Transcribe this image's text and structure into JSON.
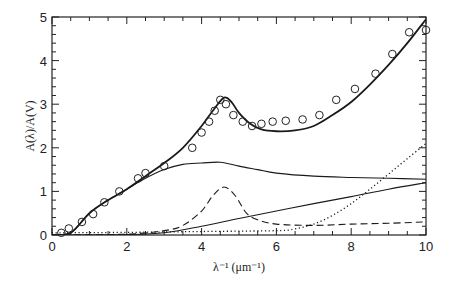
{
  "chart_data": {
    "type": "line",
    "title": "",
    "xlabel": "λ⁻¹ (μm⁻¹)",
    "ylabel": "A(λ)/A(V)",
    "xlim": [
      0,
      10
    ],
    "ylim": [
      0,
      5
    ],
    "xticks": [
      0,
      2,
      4,
      6,
      8,
      10
    ],
    "yticks": [
      0,
      1,
      2,
      3,
      4,
      5
    ],
    "grid": false,
    "legend": null,
    "observations": {
      "name": "observed extinction (open circles)",
      "x": [
        0.25,
        0.45,
        0.8,
        1.1,
        1.4,
        1.8,
        2.3,
        2.5,
        3.0,
        3.75,
        4.0,
        4.2,
        4.35,
        4.5,
        4.65,
        4.85,
        5.1,
        5.35,
        5.6,
        5.9,
        6.25,
        6.7,
        7.15,
        7.6,
        8.1,
        8.65,
        9.1,
        9.55,
        10.0
      ],
      "y": [
        0.05,
        0.15,
        0.3,
        0.48,
        0.75,
        1.0,
        1.3,
        1.42,
        1.58,
        2.0,
        2.35,
        2.6,
        2.85,
        3.1,
        3.0,
        2.75,
        2.6,
        2.5,
        2.55,
        2.6,
        2.62,
        2.65,
        2.75,
        3.1,
        3.35,
        3.7,
        4.15,
        4.65,
        4.7
      ]
    },
    "series": [
      {
        "name": "total model (thick solid)",
        "style": "solid-thick",
        "x": [
          0,
          0.5,
          1,
          1.5,
          2,
          2.5,
          3,
          3.5,
          4,
          4.3,
          4.6,
          4.8,
          5.0,
          5.3,
          5.6,
          6.0,
          6.5,
          7,
          7.5,
          8,
          8.5,
          9,
          9.5,
          10
        ],
        "y": [
          0,
          0.05,
          0.5,
          0.8,
          1.05,
          1.35,
          1.65,
          2.0,
          2.5,
          2.85,
          3.15,
          3.05,
          2.8,
          2.55,
          2.42,
          2.38,
          2.4,
          2.5,
          2.75,
          3.05,
          3.45,
          3.9,
          4.4,
          4.95
        ]
      },
      {
        "name": "large grain component (thin solid)",
        "style": "solid-thin",
        "x": [
          0,
          0.5,
          1,
          1.5,
          2,
          2.5,
          3,
          3.5,
          4,
          4.5,
          5,
          5.5,
          6,
          7,
          8,
          9,
          10
        ],
        "y": [
          0,
          0.05,
          0.5,
          0.8,
          1.05,
          1.3,
          1.5,
          1.62,
          1.65,
          1.67,
          1.58,
          1.5,
          1.42,
          1.35,
          1.32,
          1.3,
          1.28
        ]
      },
      {
        "name": "small grain component (thin solid, rising)",
        "style": "solid-thin",
        "x": [
          0,
          2,
          3,
          4,
          5,
          6,
          7,
          8,
          9,
          10
        ],
        "y": [
          0,
          0.01,
          0.05,
          0.2,
          0.38,
          0.55,
          0.72,
          0.88,
          1.05,
          1.2
        ]
      },
      {
        "name": "2175 Å bump / graphite (dashed)",
        "style": "dashed",
        "x": [
          0,
          2,
          3,
          3.5,
          4,
          4.3,
          4.6,
          4.9,
          5.2,
          5.5,
          6,
          7,
          8,
          9,
          10
        ],
        "y": [
          0,
          0.02,
          0.1,
          0.22,
          0.55,
          0.9,
          1.1,
          0.9,
          0.5,
          0.35,
          0.25,
          0.22,
          0.25,
          0.27,
          0.3
        ]
      },
      {
        "name": "PAH / far-UV component (dotted)",
        "style": "dotted",
        "x": [
          0,
          2,
          4,
          6,
          6.5,
          7,
          7.5,
          8,
          8.5,
          9,
          9.5,
          10
        ],
        "y": [
          0.05,
          0.06,
          0.08,
          0.1,
          0.14,
          0.25,
          0.45,
          0.72,
          1.05,
          1.4,
          1.75,
          2.1
        ]
      }
    ]
  },
  "axes": {
    "x_title": "λ⁻¹ (μm⁻¹)",
    "y_title": "A(λ)/A(V)",
    "x_tick_labels": [
      "0",
      "2",
      "4",
      "6",
      "8",
      "10"
    ],
    "y_tick_labels": [
      "0",
      "1",
      "2",
      "3",
      "4",
      "5"
    ]
  }
}
